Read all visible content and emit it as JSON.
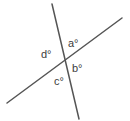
{
  "figure": {
    "name": "intersecting-lines-angle-diagram",
    "width": 130,
    "height": 121,
    "background_color": "#ffffff",
    "line_color": "#555555",
    "line_width": 1.5,
    "text_color": "#3c3c3c",
    "font_size": 11
  },
  "lines": [
    {
      "name": "steep-line",
      "x1": 52,
      "y1": 4,
      "x2": 79,
      "y2": 119
    },
    {
      "name": "shallow-line",
      "x1": 7,
      "y1": 103,
      "x2": 122,
      "y2": 18
    }
  ],
  "intersection": {
    "x": 62,
    "y": 61
  },
  "labels": {
    "a": "a°",
    "b": "b°",
    "c": "c°",
    "d": "d°"
  }
}
